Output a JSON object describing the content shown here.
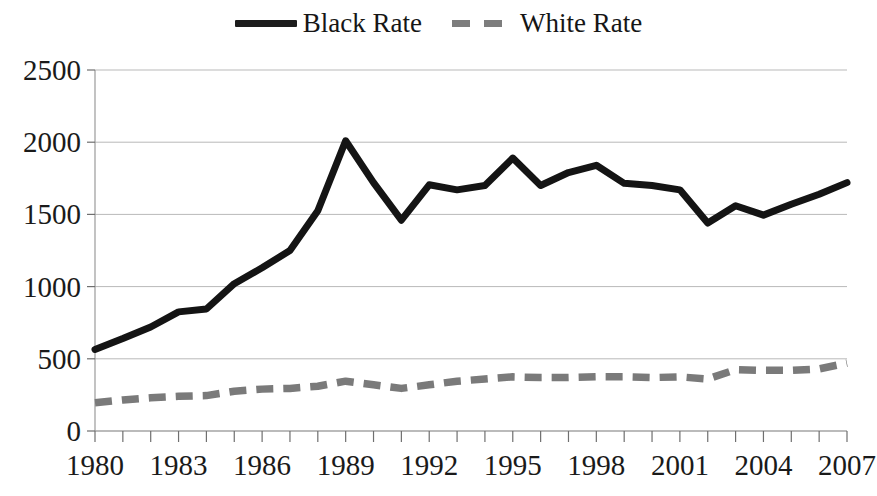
{
  "legend": {
    "position": "top-center",
    "entries": [
      {
        "label": "Black Rate",
        "style": "solid",
        "color": "#1c1c1c",
        "icon": "solid-line-swatch"
      },
      {
        "label": "White Rate",
        "style": "dashed",
        "color": "#7d7d7d",
        "icon": "dashed-line-swatch"
      }
    ]
  },
  "chart_data": {
    "type": "line",
    "title": "",
    "subtitle": "",
    "xlabel": "",
    "ylabel": "",
    "xlim": [
      1980,
      2007
    ],
    "ylim": [
      0,
      2500
    ],
    "grid": true,
    "legend_position": "top-center",
    "x": [
      1980,
      1981,
      1982,
      1983,
      1984,
      1985,
      1986,
      1987,
      1988,
      1989,
      1990,
      1991,
      1992,
      1993,
      1994,
      1995,
      1996,
      1997,
      1998,
      1999,
      2000,
      2001,
      2002,
      2003,
      2004,
      2005,
      2006,
      2007
    ],
    "xtick_labels": [
      "1980",
      "1983",
      "1986",
      "1989",
      "1992",
      "1995",
      "1998",
      "2001",
      "2004",
      "2007"
    ],
    "xtick_values": [
      1980,
      1983,
      1986,
      1989,
      1992,
      1995,
      1998,
      2001,
      2004,
      2007
    ],
    "xtick_every": 1,
    "ytick_labels": [
      "0",
      "500",
      "1000",
      "1500",
      "2000",
      "2500"
    ],
    "ytick_values": [
      0,
      500,
      1000,
      1500,
      2000,
      2500
    ],
    "series": [
      {
        "name": "Black Rate",
        "color": "#141414",
        "style": "solid",
        "values": [
          565,
          640,
          720,
          825,
          845,
          1020,
          1130,
          1250,
          1525,
          2010,
          1720,
          1460,
          1705,
          1670,
          1700,
          1890,
          1700,
          1790,
          1840,
          1715,
          1700,
          1670,
          1440,
          1560,
          1495,
          1570,
          1640,
          1720
        ]
      },
      {
        "name": "White Rate",
        "color": "#7a7a7a",
        "style": "dashed",
        "values": [
          195,
          215,
          230,
          240,
          245,
          275,
          290,
          295,
          310,
          345,
          320,
          295,
          320,
          345,
          360,
          375,
          370,
          370,
          375,
          375,
          370,
          375,
          360,
          425,
          420,
          420,
          430,
          470
        ]
      }
    ]
  }
}
